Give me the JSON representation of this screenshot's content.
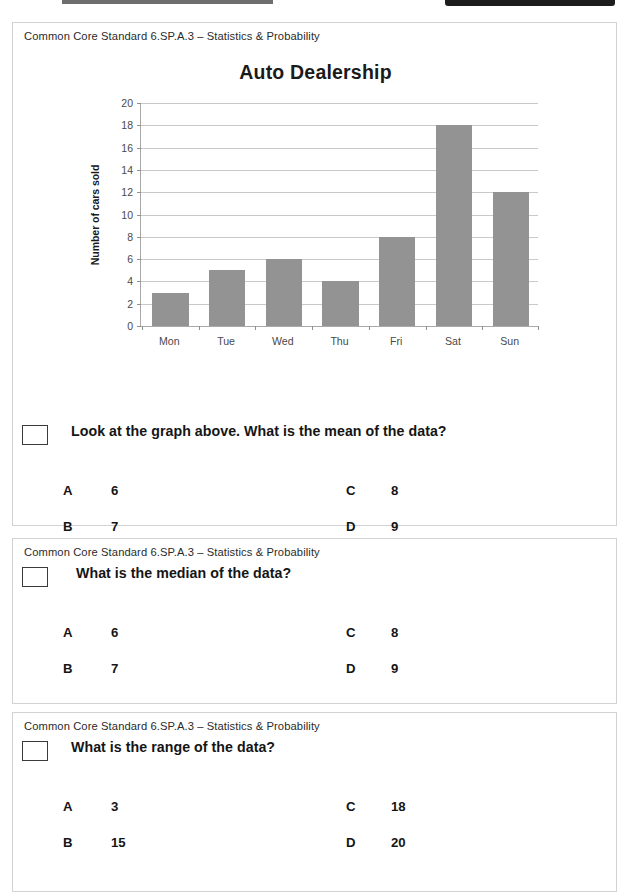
{
  "worksheet": {
    "standard_label": "Common Core Standard 6.SP.A.3 – Statistics & Probability"
  },
  "chart_data": {
    "type": "bar",
    "title": "Auto Dealership",
    "xlabel": "",
    "ylabel": "Number of cars sold",
    "categories": [
      "Mon",
      "Tue",
      "Wed",
      "Thu",
      "Fri",
      "Sat",
      "Sun"
    ],
    "values": [
      3,
      5,
      6,
      4,
      8,
      18,
      12
    ],
    "ylim": [
      0,
      20
    ],
    "ytick_labels": [
      "0",
      "2",
      "4",
      "6",
      "8",
      "10",
      "12",
      "14",
      "16",
      "18",
      "20"
    ],
    "ytick_values": [
      0,
      2,
      4,
      6,
      8,
      10,
      12,
      14,
      16,
      18,
      20
    ],
    "grid": true,
    "legend": false,
    "bar_color": "#939393",
    "gridline_color": "#c9c9c9"
  },
  "questions": [
    {
      "standard": "Common Core Standard 6.SP.A.3 – Statistics & Probability",
      "prompt": "Look at the graph above. What is the mean of the data?",
      "choices": [
        {
          "letter": "A",
          "value": "6"
        },
        {
          "letter": "B",
          "value": "7"
        },
        {
          "letter": "C",
          "value": "8"
        },
        {
          "letter": "D",
          "value": "9"
        }
      ]
    },
    {
      "standard": "Common Core Standard 6.SP.A.3 – Statistics & Probability",
      "prompt": "What is the median of the data?",
      "choices": [
        {
          "letter": "A",
          "value": "6"
        },
        {
          "letter": "B",
          "value": "7"
        },
        {
          "letter": "C",
          "value": "8"
        },
        {
          "letter": "D",
          "value": "9"
        }
      ]
    },
    {
      "standard": "Common Core Standard 6.SP.A.3 – Statistics & Probability",
      "prompt": "What is the range of the data?",
      "choices": [
        {
          "letter": "A",
          "value": "3"
        },
        {
          "letter": "B",
          "value": "15"
        },
        {
          "letter": "C",
          "value": "18"
        },
        {
          "letter": "D",
          "value": "20"
        }
      ]
    }
  ]
}
